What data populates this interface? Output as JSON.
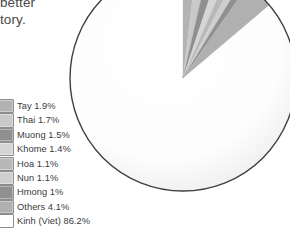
{
  "document_excerpt": {
    "lines": [
      "better",
      "tory."
    ]
  },
  "chart_data": {
    "type": "pie",
    "title": "",
    "xlabel": "",
    "ylabel": "",
    "legend_position": "left",
    "grid": false,
    "units": "percent",
    "categories": [
      "Tay",
      "Thai",
      "Muong",
      "Khome",
      "Hoa",
      "Nun",
      "Hmong",
      "Others",
      "Kinh (Viet)"
    ],
    "values": [
      1.9,
      1.7,
      1.5,
      1.4,
      1.1,
      1.1,
      1.0,
      4.1,
      86.2
    ],
    "labels": [
      "Tay 1.9%",
      "Thai 1.7%",
      "Muong 1.5%",
      "Khome 1.4%",
      "Hoa 1.1%",
      "Nun 1.1%",
      "Hmong 1%",
      "Others 4.1%",
      "Kinh (Viet) 86.2%"
    ],
    "colors": [
      "#b3b3b3",
      "#c9c9c9",
      "#8f8f8f",
      "#d5d5d5",
      "#b8b8b8",
      "#cfcfcf",
      "#909090",
      "#b0b0b0",
      "#ffffff"
    ],
    "start_angle_deg": -90,
    "outline_color": "#3f3f3f",
    "center": {
      "x": 183,
      "y": 78
    },
    "radius": 113
  },
  "legend": {
    "items": [
      {
        "label": "Tay 1.9%",
        "color": "#b3b3b3"
      },
      {
        "label": "Thai 1.7%",
        "color": "#c9c9c9"
      },
      {
        "label": "Muong 1.5%",
        "color": "#8f8f8f"
      },
      {
        "label": "Khome 1.4%",
        "color": "#d5d5d5"
      },
      {
        "label": "Hoa 1.1%",
        "color": "#b8b8b8"
      },
      {
        "label": "Nun 1.1%",
        "color": "#cfcfcf"
      },
      {
        "label": "Hmong 1%",
        "color": "#909090"
      },
      {
        "label": "Others 4.1%",
        "color": "#b0b0b0"
      },
      {
        "label": "Kinh (Viet) 86.2%",
        "color": "#ffffff"
      }
    ]
  }
}
